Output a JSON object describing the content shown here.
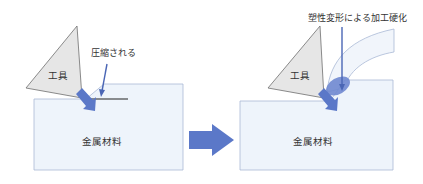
{
  "colors": {
    "block_fill": "#eef4fb",
    "block_stroke": "#a9b9d6",
    "tool_fill": "#e6e6e6",
    "tool_stroke": "#6e6e6e",
    "arrow_blue": "#5b78c8",
    "pointer_blue": "#4a66b5",
    "chip_fill": "#f1f5fb",
    "chip_stroke": "#a9b9d6",
    "hardened_zone": "#6f88d0"
  },
  "left_panel": {
    "tool_label": "工具",
    "annotation_label": "圧縮される",
    "material_label": "金属材料"
  },
  "transition_arrow": {
    "icon": "right-arrow"
  },
  "right_panel": {
    "tool_label": "工具",
    "annotation_label": "塑性変形による加工硬化",
    "material_label": "金属材料"
  }
}
